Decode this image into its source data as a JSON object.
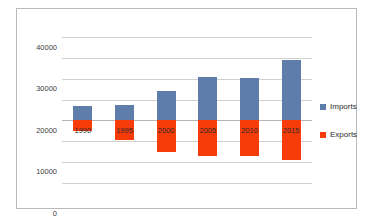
{
  "chart_data": {
    "type": "bar",
    "title": "",
    "subtitle": "",
    "xlabel": "",
    "ylabel": "",
    "categories": [
      "1990",
      "1995",
      "2000",
      "2005",
      "2010",
      "2015"
    ],
    "series": [
      {
        "name": "Imports",
        "color": "#5f7daa",
        "values": [
          7000,
          7500,
          14000,
          20800,
          20500,
          29000
        ]
      },
      {
        "name": "Exports",
        "color": "#f73b09",
        "values": [
          -5000,
          -9500,
          -15200,
          -17200,
          -17200,
          -19000
        ]
      }
    ],
    "stacked": true,
    "ylim": [
      -35000,
      45000
    ],
    "yticks": [
      40000,
      30000,
      20000,
      10000,
      0,
      -10000,
      -20000,
      -30000
    ],
    "ytick_labels": [
      "40000",
      "30000",
      "20000",
      "10000",
      "0",
      "−10000",
      "−20000",
      "−30000"
    ],
    "grid": true,
    "legend_position": "right",
    "legend": [
      {
        "label": "Imports",
        "color": "#5f7daa"
      },
      {
        "label": "Exports",
        "color": "#f73b09"
      }
    ]
  }
}
